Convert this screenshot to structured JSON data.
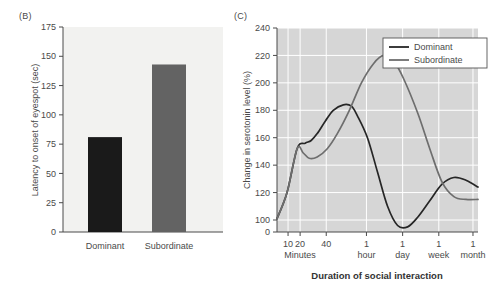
{
  "figure": {
    "panel_b_label": "(B)",
    "panel_c_label": "(C)"
  },
  "chart_data": [
    {
      "panel": "(B)",
      "type": "bar",
      "title": "",
      "xlabel": "",
      "ylabel": "Latency to onset of eyespot (sec)",
      "categories": [
        "Dominant",
        "Subordinate"
      ],
      "values": [
        81,
        143
      ],
      "ylim": [
        0,
        175
      ],
      "yticks": [
        0,
        25,
        50,
        75,
        100,
        125,
        150,
        175
      ],
      "ytick_labels": [
        "0",
        "25",
        "50",
        "75",
        "100",
        "125",
        "150",
        "175"
      ],
      "grid": false,
      "legend": "none",
      "colors": [
        "#1a1a1a",
        "#636363"
      ],
      "plot_background": "#f2f2f0"
    },
    {
      "panel": "(C)",
      "type": "line",
      "title": "",
      "xlabel": "Duration of social interaction",
      "ylabel": "Change in serotonin level (%)",
      "ylim": [
        0,
        240
      ],
      "yticks": [
        0,
        100,
        120,
        140,
        160,
        180,
        200,
        220,
        240
      ],
      "ytick_labels": [
        "0",
        "100",
        "120",
        "140",
        "160",
        "180",
        "200",
        "220",
        "240"
      ],
      "axis_break": true,
      "xtick_labels": [
        "10",
        "20",
        "40",
        "1",
        "1",
        "1",
        "1"
      ],
      "xtick_sublabels": [
        "",
        "Minutes",
        "",
        "hour",
        "day",
        "week",
        "month"
      ],
      "grid": true,
      "grid_color": "#ffffff",
      "plot_background": "#d6d6d6",
      "legend_position": "top-right",
      "series": [
        {
          "name": "Dominant",
          "color": "#262626",
          "x": [
            0.0,
            0.05,
            0.1,
            0.14,
            0.17,
            0.2,
            0.24,
            0.28,
            0.33,
            0.37,
            0.4,
            0.45,
            0.5,
            0.55,
            0.6,
            0.65,
            0.7,
            0.76,
            0.82,
            0.88,
            0.94,
            1.0
          ],
          "y": [
            101,
            120,
            152,
            156,
            158,
            163,
            172,
            180,
            184,
            183,
            176,
            160,
            135,
            110,
            96,
            95,
            102,
            114,
            126,
            131,
            129,
            124
          ]
        },
        {
          "name": "Subordinate",
          "color": "#6e6e6e",
          "x": [
            0.0,
            0.05,
            0.1,
            0.13,
            0.16,
            0.2,
            0.25,
            0.3,
            0.36,
            0.42,
            0.48,
            0.53,
            0.58,
            0.63,
            0.7,
            0.76,
            0.82,
            0.88,
            0.94,
            1.0
          ],
          "y": [
            101,
            120,
            152,
            149,
            145,
            146,
            152,
            163,
            180,
            200,
            214,
            220,
            216,
            203,
            178,
            152,
            128,
            117,
            115,
            115
          ]
        }
      ]
    }
  ]
}
